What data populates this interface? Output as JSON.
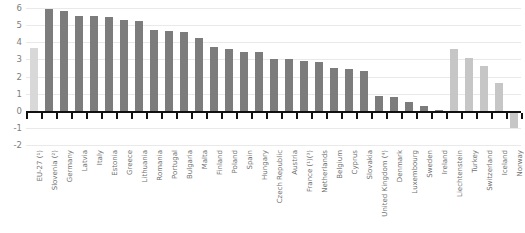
{
  "chart_data": {
    "type": "bar",
    "title": "",
    "subtitle": "",
    "xlabel": "",
    "ylabel": "",
    "ylim": [
      -2,
      6
    ],
    "yticks": [
      6,
      5,
      4,
      3,
      2,
      1,
      0,
      -1,
      -2
    ],
    "ytick_labels": [
      "6",
      "5",
      "4",
      "3",
      "2",
      "1",
      "0",
      "-1",
      "-2"
    ],
    "grid": true,
    "legend": "none",
    "orientation": "vertical",
    "categories": [
      "EU-27 (¹)",
      "Slovenia (²)",
      "Germany",
      "Latvia",
      "Italy",
      "Estonia",
      "Greece",
      "Lithuania",
      "Romania",
      "Portugal",
      "Bulgaria",
      "Malta",
      "Finland",
      "Poland",
      "Spain",
      "Hungary",
      "Czech Republic",
      "Austria",
      "France (¹)(³)",
      "Netherlands",
      "Belgium",
      "Cyprus",
      "Slovakia",
      "United Kingdom (⁴)",
      "Denmark",
      "Luxembourg",
      "Sweden",
      "Ireland",
      "Liechtenstein",
      "Turkey",
      "Switzerland",
      "Iceland",
      "Norway"
    ],
    "values": [
      3.65,
      5.95,
      5.8,
      5.55,
      5.55,
      5.5,
      5.3,
      5.25,
      4.7,
      4.65,
      4.6,
      4.25,
      3.75,
      3.6,
      3.45,
      3.45,
      3.05,
      3.0,
      2.9,
      2.85,
      2.5,
      2.45,
      2.35,
      0.85,
      0.8,
      0.5,
      0.25,
      0.05,
      3.6,
      3.1,
      2.6,
      1.6,
      -1.0
    ],
    "series_groups": [
      {
        "name": "EU aggregate",
        "color": "#d8d8d8",
        "indices": [
          0
        ]
      },
      {
        "name": "EU Member States",
        "color": "#7c7c7c",
        "indices": [
          1,
          2,
          3,
          4,
          5,
          6,
          7,
          8,
          9,
          10,
          11,
          12,
          13,
          14,
          15,
          16,
          17,
          18,
          19,
          20,
          21,
          22,
          23,
          24,
          25,
          26,
          27
        ]
      },
      {
        "name": "EFTA and candidate countries",
        "color": "#c6c6c6",
        "indices": [
          28,
          29,
          30,
          31,
          32
        ]
      }
    ]
  }
}
